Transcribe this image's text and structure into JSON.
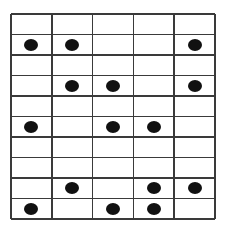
{
  "grid": {
    "rows": 10,
    "cols": 5,
    "line_color": "#3a3a3a",
    "dot_color": "#111111",
    "cells": [
      [
        0,
        0,
        0,
        0,
        0
      ],
      [
        1,
        1,
        0,
        0,
        1
      ],
      [
        0,
        0,
        0,
        0,
        0
      ],
      [
        0,
        1,
        1,
        0,
        1
      ],
      [
        0,
        0,
        0,
        0,
        0
      ],
      [
        1,
        0,
        1,
        1,
        0
      ],
      [
        0,
        0,
        0,
        0,
        0
      ],
      [
        0,
        0,
        0,
        0,
        0
      ],
      [
        0,
        1,
        0,
        1,
        1
      ],
      [
        1,
        0,
        1,
        1,
        0
      ]
    ]
  }
}
